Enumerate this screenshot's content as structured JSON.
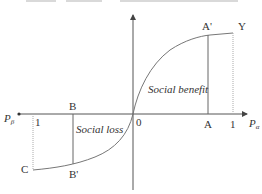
{
  "diagram": {
    "colors": {
      "line": "#555555",
      "curve": "#777777",
      "text": "#333333",
      "dotted": "#999999"
    },
    "axes": {
      "x_right_label": "P",
      "x_right_sub": "α",
      "x_left_label": "P",
      "x_left_sub": "β",
      "origin_label": "0"
    },
    "points": {
      "A": "A",
      "A_prime": "A'",
      "Y": "Y",
      "B": "B",
      "B_prime": "B'",
      "C": "C",
      "right_one": "1",
      "left_one": "1"
    },
    "regions": {
      "benefit": "Social benefit",
      "loss": "Social loss"
    }
  }
}
